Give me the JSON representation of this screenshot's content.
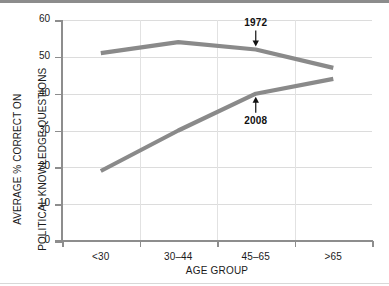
{
  "chart_data": {
    "type": "line",
    "title": "",
    "subtitle": "",
    "xlabel": "AGE GROUP",
    "ylabel": "AVERAGE % CORRECT ON POLITICAL KNOWLEDGE QUESTIONS",
    "ylabel_line1": "AVERAGE % CORRECT ON",
    "ylabel_line2": "POLITICAL KNOWLEDGE QUESTIONS",
    "categories": [
      "<30",
      "30–44",
      "45–65",
      ">65"
    ],
    "ylim": [
      0,
      60
    ],
    "yticks": [
      0,
      10,
      20,
      30,
      40,
      50,
      60
    ],
    "ytick_labels": [
      "0",
      "10",
      "20",
      "30",
      "40",
      "50",
      "60"
    ],
    "grid": "horizontal-and-vertical",
    "legend": "none",
    "series": [
      {
        "name": "1972",
        "values": [
          51,
          54,
          52,
          47
        ],
        "color": "#8a8a8a"
      },
      {
        "name": "2008",
        "values": [
          19,
          30,
          40,
          44
        ],
        "color": "#8a8a8a"
      }
    ],
    "annotations": [
      {
        "text": "1972",
        "series": "1972",
        "category": "45–65",
        "arrow": "down"
      },
      {
        "text": "2008",
        "series": "2008",
        "category": "45–65",
        "arrow": "up"
      }
    ]
  },
  "colors": {
    "line": "#8a8a8a",
    "axis": "#8d8d8d",
    "grid": "#dcdcdc",
    "text": "#1a1a1a",
    "topbar": "#8c8c8c"
  }
}
